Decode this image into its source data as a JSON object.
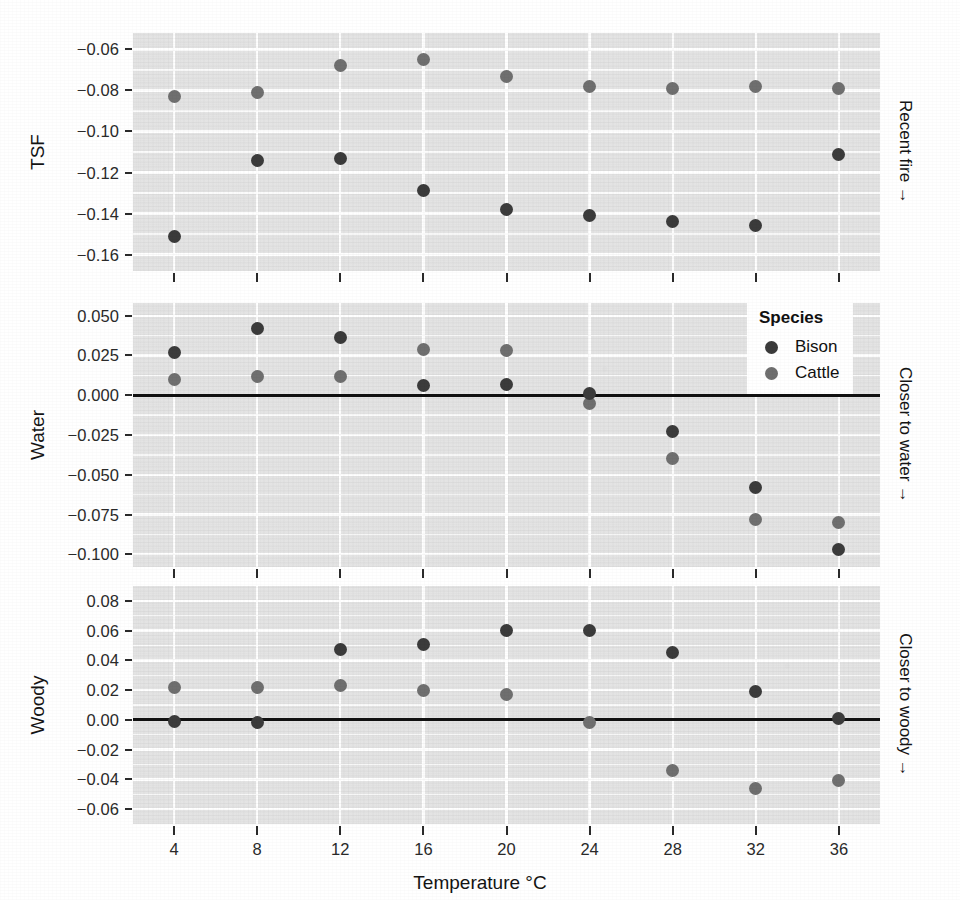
{
  "chart_data": {
    "type": "scatter",
    "title": "",
    "xlabel": "Temperature °C",
    "x": [
      4,
      8,
      12,
      16,
      20,
      24,
      28,
      32,
      36
    ],
    "xtick_labels": [
      "4",
      "8",
      "12",
      "16",
      "20",
      "24",
      "28",
      "32",
      "36"
    ],
    "legend": {
      "title": "Species",
      "position": "top-right-of-middle-panel",
      "entries": [
        {
          "name": "Bison",
          "color": "#3b3b3b"
        },
        {
          "name": "Cattle",
          "color": "#6f6f6f"
        }
      ]
    },
    "grid": true,
    "panels": [
      {
        "ylabel": "TSF",
        "strip_label": "Recent fire →",
        "ylim": [
          -0.168,
          -0.052
        ],
        "ytick_labels": [
          "-0.06",
          "-0.08",
          "-0.10",
          "-0.12",
          "-0.14",
          "-0.16"
        ],
        "yticks": [
          -0.06,
          -0.08,
          -0.1,
          -0.12,
          -0.14,
          -0.16
        ],
        "zero_line": false,
        "series": [
          {
            "name": "Bison",
            "color": "#3b3b3b",
            "values": [
              -0.151,
              -0.114,
              -0.113,
              -0.129,
              -0.138,
              -0.141,
              -0.144,
              -0.146,
              -0.111
            ]
          },
          {
            "name": "Cattle",
            "color": "#6f6f6f",
            "values": [
              -0.083,
              -0.081,
              -0.068,
              -0.065,
              -0.073,
              -0.078,
              -0.079,
              -0.078,
              -0.079
            ]
          }
        ]
      },
      {
        "ylabel": "Water",
        "strip_label": "Closer to water →",
        "ylim": [
          -0.108,
          0.058
        ],
        "ytick_labels": [
          "0.050",
          "0.025",
          "0.000",
          "-0.025",
          "-0.050",
          "-0.075",
          "-0.100"
        ],
        "yticks": [
          0.05,
          0.025,
          0.0,
          -0.025,
          -0.05,
          -0.075,
          -0.1
        ],
        "zero_line": true,
        "series": [
          {
            "name": "Bison",
            "color": "#3b3b3b",
            "values": [
              0.027,
              0.042,
              0.036,
              0.006,
              0.007,
              0.001,
              -0.023,
              -0.058,
              -0.097
            ]
          },
          {
            "name": "Cattle",
            "color": "#6f6f6f",
            "values": [
              0.01,
              0.012,
              0.012,
              0.029,
              0.028,
              -0.005,
              -0.04,
              -0.078,
              -0.08
            ]
          }
        ]
      },
      {
        "ylabel": "Woody",
        "strip_label": "Closer to woody →",
        "ylim": [
          -0.07,
          0.09
        ],
        "ytick_labels": [
          "0.08",
          "0.06",
          "0.04",
          "0.02",
          "0.00",
          "-0.02",
          "-0.04",
          "-0.06"
        ],
        "yticks": [
          0.08,
          0.06,
          0.04,
          0.02,
          0.0,
          -0.02,
          -0.04,
          -0.06
        ],
        "zero_line": true,
        "series": [
          {
            "name": "Bison",
            "color": "#3b3b3b",
            "values": [
              -0.001,
              -0.002,
              0.047,
              0.051,
              0.06,
              0.06,
              0.045,
              0.019,
              0.001
            ]
          },
          {
            "name": "Cattle",
            "color": "#6f6f6f",
            "values": [
              0.022,
              0.022,
              0.023,
              0.02,
              0.017,
              -0.002,
              -0.034,
              -0.046,
              -0.041
            ]
          }
        ]
      }
    ]
  }
}
